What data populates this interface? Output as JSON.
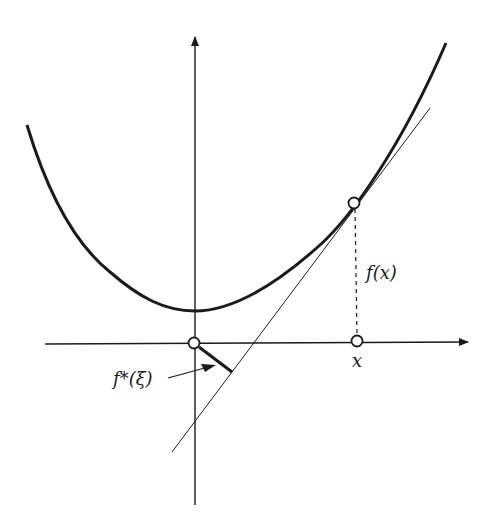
{
  "figure": {
    "colors": {
      "background": "#ffffff",
      "ink": "#1a1a1a"
    },
    "labels": {
      "fx": "f(x)",
      "x": "x",
      "fstar": "f*(ξ)"
    },
    "elements": {
      "x_axis": {
        "from": [
          45,
          344
        ],
        "to": [
          470,
          342
        ],
        "arrow": "right"
      },
      "y_axis": {
        "from": [
          195,
          505
        ],
        "to": [
          195,
          35
        ],
        "arrow": "up"
      },
      "curve": {
        "type": "convex",
        "left_end": [
          27,
          125
        ],
        "minimum": [
          195,
          311
        ],
        "right_end": [
          446,
          43
        ]
      },
      "tangent_line": {
        "from": [
          172,
          452
        ],
        "to": [
          430,
          108
        ],
        "touch_point": [
          354,
          203
        ]
      },
      "vertical_dashed": {
        "from": [
          354,
          203
        ],
        "to": [
          357,
          341
        ]
      },
      "points": [
        {
          "name": "origin",
          "at": [
            194,
            343
          ]
        },
        {
          "name": "tangent-point",
          "at": [
            354,
            203
          ]
        },
        {
          "name": "x-point",
          "at": [
            357,
            341
          ]
        }
      ],
      "conjugate_segment": {
        "from": [
          197,
          346
        ],
        "to": [
          232,
          372
        ]
      }
    }
  }
}
